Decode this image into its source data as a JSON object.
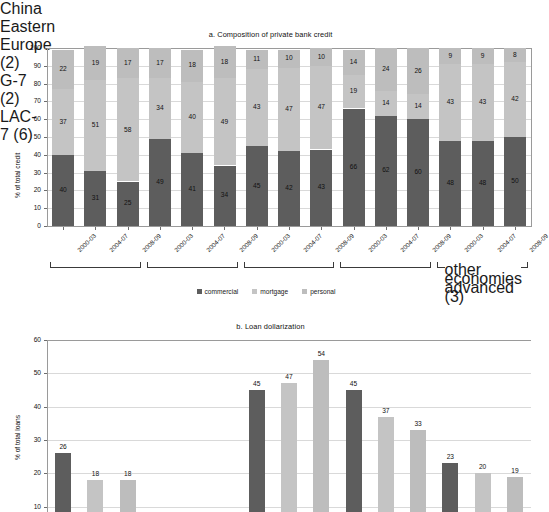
{
  "figure": {
    "panel_a_title": "a. Composition of private bank credit",
    "panel_b_title": "b. Loan dollarization"
  },
  "legend": {
    "items": [
      {
        "label": "commercial",
        "color": "#5d5d5d"
      },
      {
        "label": "mortgage",
        "color": "#c4c4c4"
      },
      {
        "label": "personal",
        "color": "#bdbdbd"
      }
    ]
  },
  "chart_data": [
    {
      "type": "bar",
      "title": "a. Composition of private bank credit",
      "stacked": true,
      "xlabel": "",
      "ylabel": "% of total credit",
      "ylim": [
        0,
        100
      ],
      "yticks": [
        0,
        10,
        20,
        30,
        40,
        50,
        60,
        70,
        80,
        90,
        100
      ],
      "grid": true,
      "legend_position": "bottom",
      "categories": [
        "2000-03",
        "2004-07",
        "2008-09",
        "2000-03",
        "2004-07",
        "2008-09",
        "2000-03",
        "2004-07",
        "2008-09",
        "2000-03",
        "2004-07",
        "2008-09",
        "2000-03",
        "2004-07",
        "2008-09"
      ],
      "groups": [
        {
          "label": "China",
          "start": 0,
          "end": 2
        },
        {
          "label": "Eastern Europe (2)",
          "start": 3,
          "end": 5
        },
        {
          "label": "G-7 (2)",
          "start": 6,
          "end": 8
        },
        {
          "label": "LAC-7 (6)",
          "start": 9,
          "end": 11
        },
        {
          "label": "other advanced economies (3)",
          "start": 12,
          "end": 14
        }
      ],
      "series": [
        {
          "name": "commercial",
          "color": "#5d5d5d",
          "values": [
            40,
            31,
            25,
            49,
            41,
            34,
            45,
            42,
            43,
            66,
            62,
            60,
            48,
            48,
            50
          ]
        },
        {
          "name": "mortgage",
          "color": "#c4c4c4",
          "values": [
            37,
            51,
            58,
            34,
            40,
            49,
            43,
            47,
            47,
            19,
            14,
            14,
            43,
            43,
            42
          ]
        },
        {
          "name": "personal",
          "color": "#bdbdbd",
          "values": [
            22,
            19,
            17,
            17,
            18,
            18,
            11,
            10,
            10,
            14,
            24,
            26,
            9,
            9,
            8
          ]
        }
      ]
    },
    {
      "type": "bar",
      "title": "b. Loan dollarization",
      "stacked": false,
      "xlabel": "",
      "ylabel": "% of total loans",
      "ylim": [
        0,
        60
      ],
      "yticks": [
        0,
        10,
        20,
        30,
        40,
        50,
        60
      ],
      "grid": true,
      "legend_position": "none",
      "categories": [
        "2000-03",
        "2004-07",
        "2008-09",
        "2000-03",
        "2004-07",
        "2008-09",
        "2000-03",
        "2004-07",
        "2008-09",
        "2000-03",
        "2004-07",
        "2008-09"
      ],
      "values": [
        26,
        18,
        18,
        null,
        null,
        null,
        45,
        47,
        54,
        45,
        37,
        33,
        23,
        20,
        19
      ],
      "bars": [
        {
          "value": 26,
          "color": "#5d5d5d"
        },
        {
          "value": 18,
          "color": "#c4c4c4"
        },
        {
          "value": 18,
          "color": "#bdbdbd"
        },
        {
          "value": 45,
          "color": "#5d5d5d"
        },
        {
          "value": 47,
          "color": "#c4c4c4"
        },
        {
          "value": 54,
          "color": "#bdbdbd"
        },
        {
          "value": 45,
          "color": "#5d5d5d"
        },
        {
          "value": 37,
          "color": "#c4c4c4"
        },
        {
          "value": 33,
          "color": "#bdbdbd"
        },
        {
          "value": 23,
          "color": "#5d5d5d"
        },
        {
          "value": 20,
          "color": "#c4c4c4"
        },
        {
          "value": 19,
          "color": "#bdbdbd"
        }
      ]
    }
  ]
}
